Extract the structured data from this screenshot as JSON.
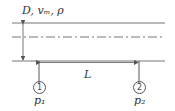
{
  "diagram": {
    "title_label": "D, vₘ, ρ",
    "length_label": "L",
    "stations": [
      {
        "number": "1",
        "pressure_label": "p₁"
      },
      {
        "number": "2",
        "pressure_label": "p₂"
      }
    ],
    "colors": {
      "line": "#555555",
      "text": "#333333"
    }
  }
}
